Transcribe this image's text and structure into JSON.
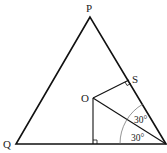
{
  "diagram": {
    "type": "geometry",
    "points": {
      "P": {
        "label": "P",
        "x": 90,
        "y": 17
      },
      "Q": {
        "label": "Q",
        "x": 16,
        "y": 144
      },
      "R": {
        "x": 166,
        "y": 144
      },
      "O": {
        "label": "O",
        "x": 93,
        "y": 98
      },
      "S": {
        "label": "S",
        "x": 129,
        "y": 80
      },
      "F": {
        "x": 93,
        "y": 144
      }
    },
    "angles": [
      {
        "label": "30°",
        "at": "R",
        "between": [
          "OR",
          "PR"
        ]
      },
      {
        "label": "30°",
        "at": "R",
        "between": [
          "QR",
          "OR"
        ]
      }
    ],
    "right_angles": [
      "S",
      "F"
    ]
  }
}
